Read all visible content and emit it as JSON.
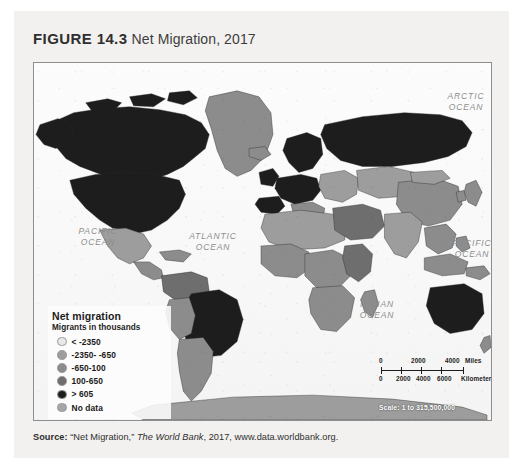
{
  "figure": {
    "label": "FIGURE 14.3",
    "caption": "Net Migration, 2017"
  },
  "map": {
    "ocean_labels": [
      {
        "name": "arctic-ocean",
        "text": "ARCTIC\nOCEAN",
        "x": 404,
        "y": 28,
        "w": 56
      },
      {
        "name": "pacific-ocean-west",
        "text": "PACIFIC\nOCEAN",
        "x": 36,
        "y": 163,
        "w": 56
      },
      {
        "name": "atlantic-ocean",
        "text": "ATLANTIC\nOCEAN",
        "x": 148,
        "y": 168,
        "w": 62
      },
      {
        "name": "indian-ocean",
        "text": "INDIAN\nOCEAN",
        "x": 315,
        "y": 236,
        "w": 56
      },
      {
        "name": "pacific-ocean-east",
        "text": "PACIFIC\nOCEAN",
        "x": 410,
        "y": 175,
        "w": 56
      }
    ]
  },
  "legend": {
    "title": "Net migration",
    "subtitle": "Migrants in thousands",
    "items": [
      {
        "label": "< -2350",
        "color": "#e9e8e6"
      },
      {
        "label": "-2350- -650",
        "color": "#9d9d9d"
      },
      {
        "label": "-650-100",
        "color": "#8c8c8c"
      },
      {
        "label": "100-650",
        "color": "#6e6e6e"
      },
      {
        "label": "> 605",
        "color": "#1d1d1d"
      },
      {
        "label": "No data",
        "color": "#a6a6a6"
      }
    ]
  },
  "scalebar": {
    "miles_ticks": [
      "0",
      "2000",
      "4000"
    ],
    "miles_unit": "Miles",
    "km_ticks": [
      "0",
      "2000",
      "4000",
      "6000"
    ],
    "km_unit": "Kilometers",
    "statement": "Scale: 1 to 315,500,000"
  },
  "source": {
    "prefix": "Source:",
    "work": "“Net Migration,”",
    "publication": "The World Bank",
    "rest": ", 2017, www.data.worldbank.org."
  },
  "chart_data": {
    "type": "map",
    "title": "Net Migration, 2017",
    "projection": "robinson",
    "variable": "Net migration (migrants in thousands)",
    "classes": [
      {
        "range": "< -2350",
        "shade": "#e9e8e6"
      },
      {
        "range": "-2350 - -650",
        "shade": "#9d9d9d"
      },
      {
        "range": "-650 - 100",
        "shade": "#8c8c8c"
      },
      {
        "range": "100 - 650",
        "shade": "#6e6e6e"
      },
      {
        "range": "> 605",
        "shade": "#1d1d1d"
      },
      {
        "range": "No data",
        "shade": "#a6a6a6"
      }
    ],
    "legend_position": "lower-left",
    "scale": "1 to 315,500,000"
  }
}
